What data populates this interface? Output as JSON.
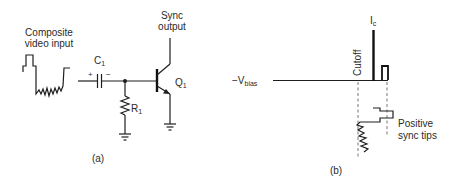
{
  "figure": {
    "panel_a": {
      "caption": "(a)",
      "input_label_line1": "Composite",
      "input_label_line2": "video input",
      "capacitor": {
        "label": "C",
        "subscript": "1",
        "plus": "+",
        "minus": "−"
      },
      "resistor": {
        "label": "R",
        "subscript": "1"
      },
      "transistor": {
        "label": "Q",
        "subscript": "1",
        "type": "NPN"
      },
      "output_label_line1": "Sync",
      "output_label_line2": "output"
    },
    "panel_b": {
      "caption": "(b)",
      "bias_label": "−V",
      "bias_subscript": "bias",
      "cutoff_label": "Cutoff",
      "current_label": "I",
      "current_subscript": "c",
      "annotation_line1": "Positive",
      "annotation_line2": "sync tips"
    },
    "colors": {
      "background": "#ffffff",
      "line": "#1e1e1e",
      "text": "#2a2a2a",
      "dashed": "#666666"
    }
  }
}
